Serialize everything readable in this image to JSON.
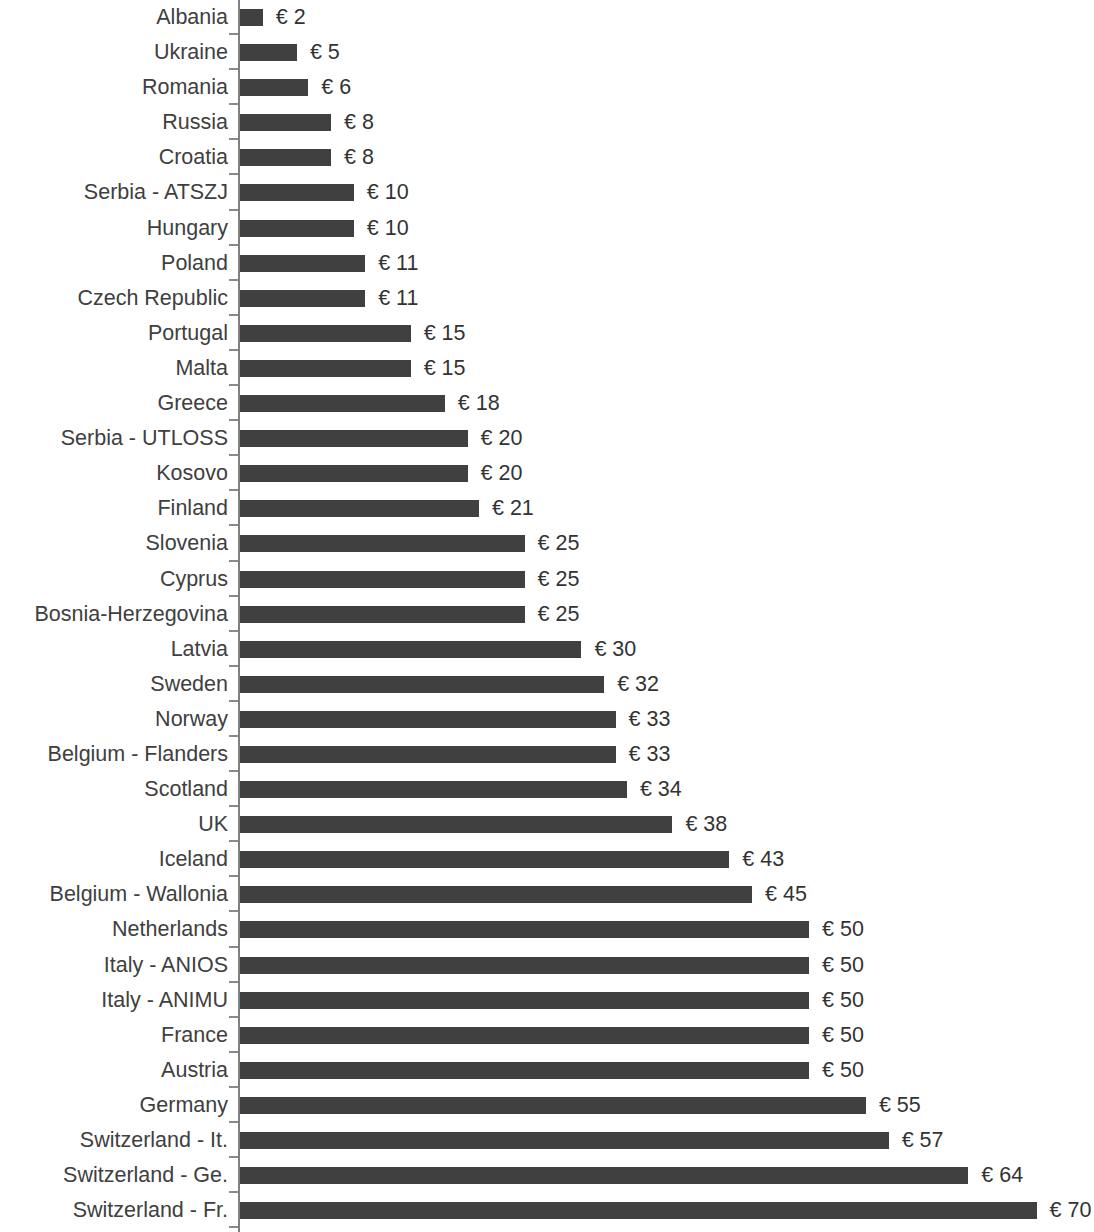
{
  "chart_data": {
    "type": "bar",
    "orientation": "horizontal",
    "title": "",
    "subtitle": "",
    "xlabel": "",
    "ylabel": "",
    "currency_symbol": "€",
    "value_label_prefix": "€ ",
    "grid": false,
    "legend": null,
    "xlim": [
      0,
      70
    ],
    "bar_color": "#404040",
    "axis_color": "#808080",
    "text_color": "#404040",
    "categories": [
      "Albania",
      "Ukraine",
      "Romania",
      "Russia",
      "Croatia",
      "Serbia - ATSZJ",
      "Hungary",
      "Poland",
      "Czech Republic",
      "Portugal",
      "Malta",
      "Greece",
      "Serbia - UTLOSS",
      "Kosovo",
      "Finland",
      "Slovenia",
      "Cyprus",
      "Bosnia-Herzegovina",
      "Latvia",
      "Sweden",
      "Norway",
      "Belgium - Flanders",
      "Scotland",
      "UK",
      "Iceland",
      "Belgium - Wallonia",
      "Netherlands",
      "Italy - ANIOS",
      "Italy - ANIMU",
      "France",
      "Austria",
      "Germany",
      "Switzerland - It.",
      "Switzerland - Ge.",
      "Switzerland - Fr."
    ],
    "values": [
      2,
      5,
      6,
      8,
      8,
      10,
      10,
      11,
      11,
      15,
      15,
      18,
      20,
      20,
      21,
      25,
      25,
      25,
      30,
      32,
      33,
      33,
      34,
      38,
      43,
      45,
      50,
      50,
      50,
      50,
      50,
      55,
      57,
      64,
      70
    ],
    "value_labels": [
      "€ 2",
      "€ 5",
      "€ 6",
      "€ 8",
      "€ 8",
      "€ 10",
      "€ 10",
      "€ 11",
      "€ 11",
      "€ 15",
      "€ 15",
      "€ 18",
      "€ 20",
      "€ 20",
      "€ 21",
      "€ 25",
      "€ 25",
      "€ 25",
      "€ 30",
      "€ 32",
      "€ 33",
      "€ 33",
      "€ 34",
      "€ 38",
      "€ 43",
      "€ 45",
      "€ 50",
      "€ 50",
      "€ 50",
      "€ 50",
      "€ 50",
      "€ 55",
      "€ 57",
      "€ 64",
      "€ 70"
    ]
  }
}
